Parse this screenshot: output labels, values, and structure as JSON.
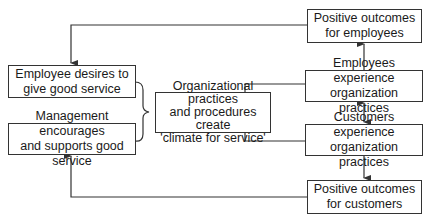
{
  "diagram": {
    "type": "flowchart",
    "nodes": {
      "employee_desires": {
        "text": "Employee desires to\ngive good service"
      },
      "management_encourages": {
        "text": "Management encourages\nand supports good service"
      },
      "climate": {
        "text": "Organizational practices\nand procedures create\n'climate for service'"
      },
      "employees_experience": {
        "text": "Employees experience\norganization practices"
      },
      "customers_experience": {
        "text": "Customers experience\norganization practices"
      },
      "outcomes_employees": {
        "text": "Positive outcomes\nfor employees"
      },
      "outcomes_customers": {
        "text": "Positive outcomes\nfor customers"
      }
    },
    "edges": [
      {
        "from": "employee_desires",
        "to": "climate",
        "style": "brace"
      },
      {
        "from": "management_encourages",
        "to": "climate",
        "style": "brace"
      },
      {
        "from": "climate",
        "to": "employees_experience",
        "style": "line"
      },
      {
        "from": "climate",
        "to": "customers_experience",
        "style": "line"
      },
      {
        "from": "employees_experience",
        "to": "customers_experience",
        "style": "double-arrow"
      },
      {
        "from": "employees_experience",
        "to": "outcomes_employees",
        "style": "arrow"
      },
      {
        "from": "customers_experience",
        "to": "outcomes_customers",
        "style": "arrow"
      },
      {
        "from": "outcomes_employees",
        "to": "employee_desires",
        "style": "arrow"
      },
      {
        "from": "outcomes_customers",
        "to": "management_encourages",
        "style": "arrow"
      }
    ],
    "colors": {
      "stroke": "#333333",
      "text": "#1a1a1a",
      "background": "#ffffff"
    }
  }
}
